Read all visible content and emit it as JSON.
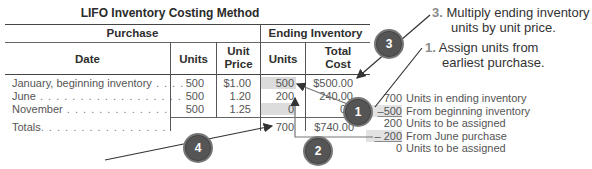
{
  "table": {
    "title": "LIFO Inventory Costing Method",
    "group_headers": [
      "Purchase",
      "Ending Inventory"
    ],
    "columns": [
      "Date",
      "Units",
      "Unit Price",
      "Units",
      "Total Cost"
    ],
    "column_lines": {
      "unit_price": [
        "Unit",
        "Price"
      ],
      "total_cost": [
        "Total",
        "Cost"
      ]
    },
    "rows": [
      {
        "date": "January, beginning inventory",
        "units": "500",
        "unit_price": "$1.00",
        "end_units": "500",
        "total_cost": "$500.00"
      },
      {
        "date": "June",
        "units": "500",
        "unit_price": "1.20",
        "end_units": "200",
        "total_cost": "240.00"
      },
      {
        "date": "November",
        "units": "500",
        "unit_price": "1.25",
        "end_units": "0",
        "total_cost": "0"
      }
    ],
    "totals": {
      "label": "Totals",
      "end_units": "700",
      "total_cost": "$740.00"
    }
  },
  "notes": {
    "step3": {
      "number": "3.",
      "line1": "Multiply ending inventory",
      "line2": "units by unit price."
    },
    "step1": {
      "number": "1.",
      "line1": "Assign units from",
      "line2": "earliest purchase."
    }
  },
  "calculation": [
    {
      "value": "700",
      "label": "Units in ending inventory",
      "underline": false
    },
    {
      "value": "–500",
      "label": "From beginning inventory",
      "underline": true
    },
    {
      "value": "200",
      "label": "Units to be assigned",
      "underline": false
    },
    {
      "value": "– 200",
      "label": "From June purchase",
      "underline": true
    },
    {
      "value": "0",
      "label": "Units to be assigned",
      "underline": false
    }
  ],
  "badges": [
    "1",
    "2",
    "3",
    "4"
  ],
  "colors": {
    "shade": "#dcdcdc",
    "badge": "#555555",
    "rule": "#444444"
  }
}
